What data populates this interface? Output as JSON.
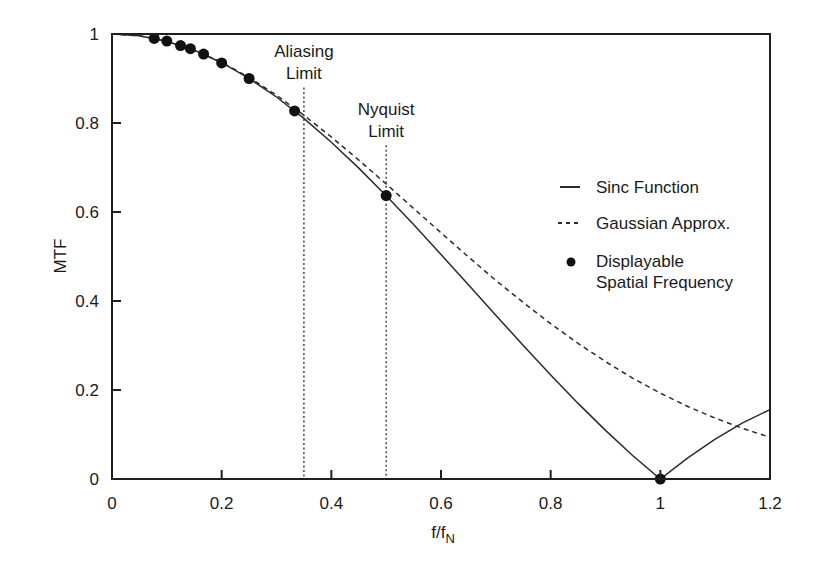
{
  "chart_data": {
    "type": "line",
    "title": "",
    "xlabel": "f/f",
    "xlabel_subscript": "N",
    "ylabel": "MTF",
    "xlim": [
      0,
      1.2
    ],
    "ylim": [
      0,
      1
    ],
    "grid": false,
    "legend_position": "right-middle inside",
    "x_ticks": [
      0,
      0.2,
      0.4,
      0.6,
      0.8,
      1,
      1.2
    ],
    "x_tick_labels": [
      "0",
      "0.2",
      "0.4",
      "0.6",
      "0.8",
      "1",
      "1.2"
    ],
    "y_ticks": [
      0,
      0.2,
      0.4,
      0.6,
      0.8,
      1
    ],
    "y_tick_labels": [
      "0",
      "0.2",
      "0.4",
      "0.6",
      "0.8",
      "1"
    ],
    "x": [
      0,
      0.05,
      0.1,
      0.15,
      0.2,
      0.25,
      0.3,
      0.35,
      0.4,
      0.45,
      0.5,
      0.55,
      0.6,
      0.65,
      0.7,
      0.75,
      0.8,
      0.85,
      0.9,
      0.95,
      1.0,
      1.05,
      1.1,
      1.15,
      1.2
    ],
    "series": [
      {
        "name": "Sinc Function",
        "style": "solid",
        "values": [
          1,
          0.9959,
          0.9836,
          0.9634,
          0.9355,
          0.9003,
          0.8584,
          0.8103,
          0.7568,
          0.6987,
          0.6366,
          0.5717,
          0.5046,
          0.4364,
          0.3679,
          0.3001,
          0.2339,
          0.17,
          0.1093,
          0.0524,
          0,
          0.0474,
          0.0894,
          0.1262,
          0.1559
        ]
      },
      {
        "name": "Gaussian Approx.",
        "style": "dashed",
        "values": [
          1,
          0.9959,
          0.9837,
          0.9637,
          0.9363,
          0.9024,
          0.8624,
          0.8175,
          0.7686,
          0.7167,
          0.6629,
          0.6081,
          0.5532,
          0.4991,
          0.4463,
          0.3967,
          0.349,
          0.3048,
          0.2638,
          0.2264,
          0.193,
          0.163,
          0.1368,
          0.1137,
          0.0936
        ]
      },
      {
        "name": "Displayable Spatial Frequency",
        "style": "markers",
        "points": [
          [
            0.077,
            0.99
          ],
          [
            0.1,
            0.984
          ],
          [
            0.125,
            0.974
          ],
          [
            0.143,
            0.967
          ],
          [
            0.167,
            0.955
          ],
          [
            0.2,
            0.935
          ],
          [
            0.25,
            0.9
          ],
          [
            0.333,
            0.827
          ],
          [
            0.5,
            0.637
          ],
          [
            1.0,
            0.0
          ]
        ]
      }
    ],
    "annotations": [
      {
        "type": "vline",
        "x": 0.35,
        "y_top": 0.88,
        "label_lines": [
          "Aliasing",
          "Limit"
        ]
      },
      {
        "type": "vline",
        "x": 0.5,
        "y_top": 0.75,
        "label_lines": [
          "Nyquist",
          "Limit"
        ]
      }
    ]
  },
  "legend": {
    "items": [
      {
        "label_lines": [
          "Sinc Function"
        ],
        "symbol": "solid-line"
      },
      {
        "label_lines": [
          "Gaussian Approx."
        ],
        "symbol": "dashed-line"
      },
      {
        "label_lines": [
          "Displayable",
          "Spatial Frequency"
        ],
        "symbol": "dot"
      }
    ]
  },
  "colors": {
    "line": "#2b2b2b",
    "axis": "#1f1f1f",
    "marker": "#111111",
    "background": "#ffffff"
  }
}
